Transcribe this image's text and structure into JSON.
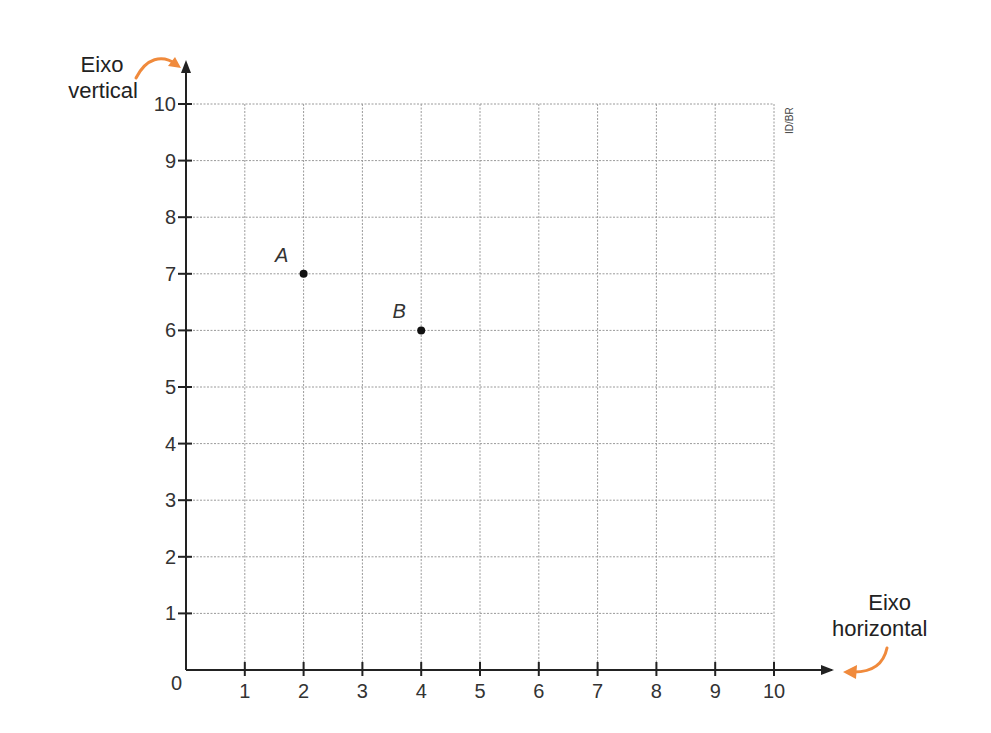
{
  "chart_data": {
    "type": "scatter",
    "title": "",
    "xlabel": "Eixo horizontal",
    "ylabel": "Eixo vertical",
    "xlim": [
      0,
      10
    ],
    "ylim": [
      0,
      10
    ],
    "grid": true,
    "x_ticks": [
      "0",
      "1",
      "2",
      "3",
      "4",
      "5",
      "6",
      "7",
      "8",
      "9",
      "10"
    ],
    "y_ticks": [
      "1",
      "2",
      "3",
      "4",
      "5",
      "6",
      "7",
      "8",
      "9",
      "10"
    ],
    "points": [
      {
        "label": "A",
        "x": 2,
        "y": 7
      },
      {
        "label": "B",
        "x": 4,
        "y": 6
      }
    ],
    "annotations": [
      "ID/BR"
    ]
  },
  "labels": {
    "y_axis_line1": "Eixo",
    "y_axis_line2": "vertical",
    "x_axis_line1": "Eixo",
    "x_axis_line2": "horizontal",
    "origin": "0",
    "credit": "ID/BR",
    "point_a": "A",
    "point_b": "B"
  },
  "colors": {
    "arrow_accent": "#f08a3c",
    "axis": "#222222",
    "grid": "#9a9a9a",
    "point": "#111111"
  }
}
